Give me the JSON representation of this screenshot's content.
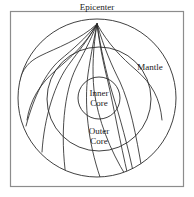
{
  "figure": {
    "type": "earth-seismic-raypath-diagram",
    "frame": {
      "x": 10,
      "y": 11,
      "width": 173,
      "height": 175,
      "stroke": "#8c8c8c",
      "stroke_width": 1.2,
      "fill": "#ffffff"
    },
    "background": "#ffffff",
    "line_color": "#2b2b2b",
    "labels": {
      "epicenter": "Epicenter",
      "mantle": "Mantle",
      "inner_core_line1": "Inner",
      "inner_core_line2": "Core",
      "outer_core_line1": "Outer",
      "outer_core_line2": "Core"
    }
  },
  "chart_data": {
    "type": "diagram",
    "title": "Epicenter",
    "subtitle": "",
    "xlabel": "",
    "ylabel": "",
    "grid": false,
    "legend": "none",
    "annotations": [
      "Epicenter",
      "Mantle",
      "Outer Core",
      "Inner Core"
    ],
    "shells": [
      {
        "name": "Mantle",
        "cx": 97,
        "cy": 98,
        "r": 79,
        "label_x": 150,
        "label_y": 70
      },
      {
        "name": "Outer Core",
        "cx": 99,
        "cy": 99,
        "r": 52,
        "label_x": 99,
        "label_y": 133
      },
      {
        "name": "Inner Core",
        "cx": 99,
        "cy": 98,
        "r": 21,
        "label_x": 99,
        "label_y": 97
      }
    ],
    "epicenter": {
      "x": 97,
      "y": 24
    },
    "ray_paths": [
      {
        "id": "ray-1",
        "d": "M 97 24 C 80 40, 56 48, 40 56 C 30 61, 22 68, 19 83"
      },
      {
        "id": "ray-2",
        "d": "M 97 24 C 86 38, 72 50, 60 60 C 46 72, 34 96, 26 126"
      },
      {
        "id": "ray-3",
        "d": "M 97 24 C 88 40, 78 52, 70 63 C 55 82, 44 118, 42 152"
      },
      {
        "id": "ray-4",
        "d": "M 97 24 C 90 42, 82 56, 76 68 C 64 92, 60 134, 66 177"
      },
      {
        "id": "ray-5",
        "d": "M 97 24 C 93 44, 90 60, 88 74 C 84 104, 88 142, 100 177"
      },
      {
        "id": "ray-6",
        "d": "M 97 24 C 100 48, 104 66, 108 82 C 114 108, 120 142, 128 176"
      },
      {
        "id": "ray-7",
        "d": "M 97 24 C 104 48, 112 66, 120 82 C 130 104, 136 134, 142 170"
      },
      {
        "id": "ray-8",
        "d": "M 97 24 C 108 44, 122 58, 136 70 C 152 84, 160 98, 162 120"
      },
      {
        "id": "ray-9",
        "d": "M 97 24 C 86 44, 70 58, 56 70 C 40 84, 30 100, 27 120"
      },
      {
        "id": "ray-10",
        "d": "M 97 24 C 93 48, 92 70, 94 90 C 98 120, 110 150, 126 176"
      },
      {
        "id": "ray-11",
        "d": "M 97 24 C 101 50, 106 72, 112 92 C 120 118, 128 146, 134 176"
      }
    ]
  }
}
